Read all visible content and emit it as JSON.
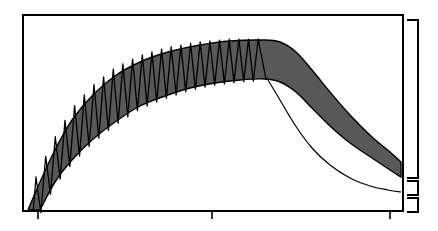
{
  "diagram": {
    "type": "schematic-plot",
    "canvas": {
      "width": 438,
      "height": 231
    },
    "colors": {
      "background": "#ffffff",
      "stroke": "#000000",
      "band_fill": "#585858"
    },
    "frame": {
      "x0": 23,
      "y0": 15,
      "x1": 403,
      "y1": 211,
      "stroke_width": 2
    },
    "x_axis_ticks": [
      {
        "x": 38,
        "y_top": 211,
        "y_bottom": 219
      },
      {
        "x": 212,
        "y_top": 211,
        "y_bottom": 219
      },
      {
        "x": 390,
        "y_top": 211,
        "y_bottom": 219
      }
    ],
    "brackets": [
      {
        "name": "upper-range",
        "x_inner": 407,
        "x_outer": 418,
        "y_top": 20,
        "y_bottom": 178
      },
      {
        "name": "middle-range",
        "x_inner": 407,
        "x_outer": 418,
        "y_top": 181,
        "y_bottom": 195
      },
      {
        "name": "lower-range",
        "x_inner": 407,
        "x_outer": 418,
        "y_top": 198,
        "y_bottom": 212
      }
    ],
    "band": {
      "upper_edge": [
        [
          28,
          210
        ],
        [
          40,
          182
        ],
        [
          55,
          150
        ],
        [
          72,
          120
        ],
        [
          92,
          96
        ],
        [
          115,
          76
        ],
        [
          140,
          62
        ],
        [
          168,
          52
        ],
        [
          200,
          45
        ],
        [
          230,
          41
        ],
        [
          262,
          40
        ],
        [
          280,
          42
        ],
        [
          296,
          52
        ],
        [
          312,
          70
        ],
        [
          330,
          92
        ],
        [
          350,
          115
        ],
        [
          372,
          137
        ],
        [
          390,
          152
        ],
        [
          401,
          162
        ]
      ],
      "lower_edge": [
        [
          401,
          177
        ],
        [
          390,
          170
        ],
        [
          372,
          158
        ],
        [
          350,
          143
        ],
        [
          330,
          126
        ],
        [
          312,
          108
        ],
        [
          296,
          92
        ],
        [
          280,
          82
        ],
        [
          265,
          79
        ],
        [
          240,
          80
        ],
        [
          215,
          83
        ],
        [
          190,
          88
        ],
        [
          165,
          96
        ],
        [
          140,
          106
        ],
        [
          115,
          122
        ],
        [
          92,
          140
        ],
        [
          72,
          160
        ],
        [
          55,
          182
        ],
        [
          40,
          210
        ]
      ]
    },
    "zigzag": {
      "count": 24,
      "x_start": 36,
      "x_end": 263,
      "peaks_follow": "band upper edge (offset upward early, converging at top)",
      "troughs_follow": "band lower edge"
    },
    "thin_curve": [
      [
        268,
        80
      ],
      [
        280,
        100
      ],
      [
        295,
        125
      ],
      [
        312,
        148
      ],
      [
        330,
        165
      ],
      [
        350,
        178
      ],
      [
        370,
        186
      ],
      [
        388,
        190
      ],
      [
        401,
        192
      ]
    ]
  }
}
